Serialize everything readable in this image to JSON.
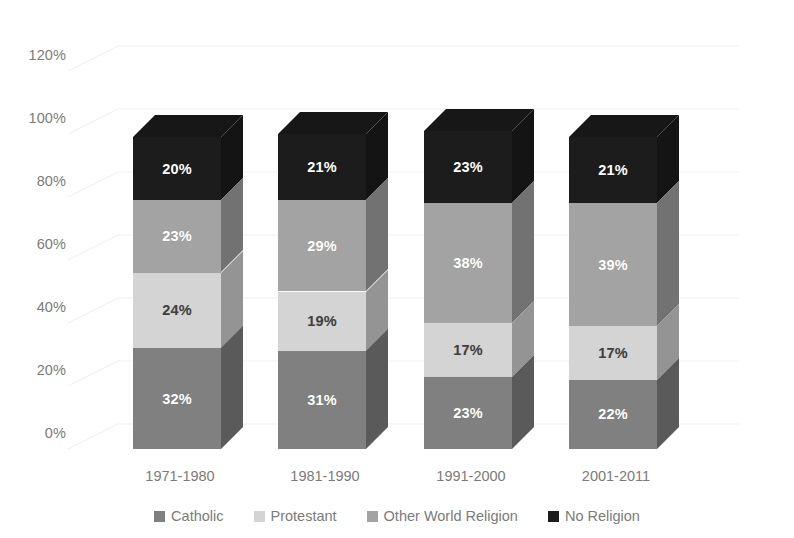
{
  "chart_data": {
    "type": "bar",
    "subtype": "stacked-100-percent-3d",
    "title": "",
    "subtitle": "",
    "xlabel": "",
    "ylabel": "",
    "categories": [
      "1971-1980",
      "1981-1990",
      "1991-2000",
      "2001-2011"
    ],
    "series": [
      {
        "name": "Catholic",
        "color": "#808080",
        "label_color": "#ffffff",
        "values": [
          32,
          31,
          23,
          22
        ],
        "value_labels": [
          "32%",
          "31%",
          "23%",
          "22%"
        ]
      },
      {
        "name": "Protestant",
        "color": "#d4d4d4",
        "label_color": "#3f3f3f",
        "values": [
          24,
          19,
          17,
          17
        ],
        "value_labels": [
          "24%",
          "19%",
          "17%",
          "17%"
        ]
      },
      {
        "name": "Other World Religion",
        "color": "#a3a3a3",
        "label_color": "#ffffff",
        "values": [
          23,
          29,
          38,
          39
        ],
        "value_labels": [
          "23%",
          "29%",
          "38%",
          "39%"
        ]
      },
      {
        "name": "No Religion",
        "color": "#1c1c1c",
        "label_color": "#ffffff",
        "values": [
          20,
          21,
          23,
          21
        ],
        "value_labels": [
          "20%",
          "21%",
          "23%",
          "21%"
        ]
      }
    ],
    "ylim": [
      0,
      120
    ],
    "ytick_values": [
      120,
      100,
      80,
      60,
      40,
      20,
      0
    ],
    "ytick_labels": [
      "120%",
      "100%",
      "80%",
      "60%",
      "40%",
      "20%",
      "0%"
    ],
    "grid": true,
    "grid_color": "#f0f0f0",
    "legend_position": "bottom",
    "axis_label_color": "#7b7b7b",
    "background_color": "#ffffff"
  },
  "legend": {
    "items": [
      {
        "label": "Catholic",
        "color": "#808080"
      },
      {
        "label": "Protestant",
        "color": "#d4d4d4"
      },
      {
        "label": "Other World Religion",
        "color": "#a3a3a3"
      },
      {
        "label": "No Religion",
        "color": "#1c1c1c"
      }
    ]
  }
}
